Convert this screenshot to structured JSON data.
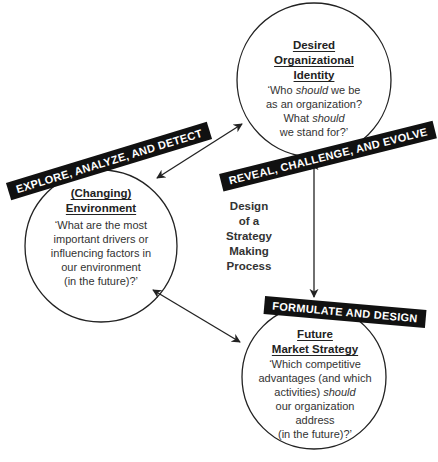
{
  "diagram": {
    "center_label": [
      "Design",
      "of a",
      "Strategy",
      "Making",
      "Process"
    ],
    "nodes": [
      {
        "id": "identity",
        "heading": [
          "Desired",
          "Organizational",
          "Identity"
        ],
        "question_parts": [
          {
            "text": "‘Who ",
            "italic": false
          },
          {
            "text": "should",
            "italic": true
          },
          {
            "text": " we be as an organization? What ",
            "italic": false
          },
          {
            "text": "should",
            "italic": true
          },
          {
            "text": " we stand for?’",
            "italic": false
          }
        ],
        "banner": "REVEAL, CHALLENGE, AND EVOLVE"
      },
      {
        "id": "environment",
        "heading": [
          "(Changing)",
          "Environment"
        ],
        "question_parts": [
          {
            "text": "‘What are the most important drivers or influencing factors in our environment (in the future)?’",
            "italic": false
          }
        ],
        "banner": "EXPLORE, ANALYZE, AND DETECT"
      },
      {
        "id": "strategy",
        "heading": [
          "Future",
          "Market Strategy"
        ],
        "question_parts": [
          {
            "text": "‘Which competitive advantages (and which activities) ",
            "italic": false
          },
          {
            "text": "should",
            "italic": true
          },
          {
            "text": " our organization address (in the future)?’",
            "italic": false
          }
        ],
        "banner": "FORMULATE AND DESIGN"
      }
    ],
    "edges": [
      {
        "from": "environment",
        "to": "identity",
        "type": "bidirectional"
      },
      {
        "from": "identity",
        "to": "strategy",
        "type": "bidirectional"
      },
      {
        "from": "environment",
        "to": "strategy",
        "type": "bidirectional"
      }
    ]
  },
  "text": {
    "identity_h1": "Desired",
    "identity_h2": "Organizational",
    "identity_h3": "Identity",
    "identity_q1a": "‘Who ",
    "identity_q1b": "should",
    "identity_q1c": " we be",
    "identity_q2": "as an organization?",
    "identity_q3a": "What ",
    "identity_q3b": "should",
    "identity_q4": "we stand for?’",
    "env_h1": "(Changing)",
    "env_h2": "Environment",
    "env_q1": "‘What are the most",
    "env_q2": "important drivers or",
    "env_q3": "influencing factors in",
    "env_q4": "our environment",
    "env_q5": "(in the future)?’",
    "strat_h1": "Future",
    "strat_h2": "Market Strategy",
    "strat_q1": "‘Which competitive",
    "strat_q2": "advantages (and which",
    "strat_q3a": "activities) ",
    "strat_q3b": "should",
    "strat_q4": "our organization",
    "strat_q5": "address",
    "strat_q6": "(in the future)?’",
    "center1": "Design",
    "center2": "of a",
    "center3": "Strategy",
    "center4": "Making",
    "center5": "Process",
    "banner_identity": "REVEAL, CHALLENGE, AND EVOLVE",
    "banner_env": "EXPLORE, ANALYZE, AND DETECT",
    "banner_strategy": "FORMULATE AND DESIGN"
  }
}
